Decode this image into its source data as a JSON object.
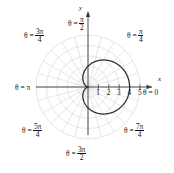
{
  "figure": {
    "type": "polar-plot",
    "background": "#ffffff",
    "grid_color": "#c9c9cf",
    "curve_color": "#2a2a2a",
    "axis_color": "#333333"
  },
  "axes": {
    "x_label": "x",
    "y_label": "y",
    "theta_zero_label": "θ = 0",
    "x_ticks": [
      "1",
      "2",
      "3",
      "4",
      "5"
    ]
  },
  "angle_labels": [
    {
      "name": "theta-pi-over-2",
      "prefix": "θ =",
      "num": "π",
      "den": "2",
      "whole": null
    },
    {
      "name": "theta-3pi-over-4",
      "prefix": "θ =",
      "num": "3π",
      "den": "4",
      "whole": null
    },
    {
      "name": "theta-pi-over-4",
      "prefix": "θ =",
      "num": "π",
      "den": "4",
      "whole": null
    },
    {
      "name": "theta-pi",
      "prefix": "θ =",
      "num": null,
      "den": null,
      "whole": "π"
    },
    {
      "name": "theta-5pi-over-4",
      "prefix": "θ =",
      "num": "5π",
      "den": "4",
      "whole": null
    },
    {
      "name": "theta-7pi-over-4",
      "prefix": "θ =",
      "num": "7π",
      "den": "4",
      "whole": null
    },
    {
      "name": "theta-3pi-over-2",
      "prefix": "θ =",
      "num": "3π",
      "den": "2",
      "whole": null
    }
  ],
  "chart_data": {
    "type": "line",
    "plot_kind": "polar",
    "title": "",
    "xlabel": "x",
    "ylabel": "y",
    "curve_name": "cardioid",
    "equation": "r = 2(1 + cos θ)",
    "r_max_axis": 5,
    "r_gridlines": [
      1,
      2,
      3,
      4,
      5
    ],
    "theta_gridlines_deg": [
      0,
      15,
      30,
      45,
      60,
      75,
      90,
      105,
      120,
      135,
      150,
      165,
      180,
      195,
      210,
      225,
      240,
      255,
      270,
      285,
      300,
      315,
      330,
      345
    ],
    "grid": true,
    "legend": "none",
    "tick_labels_x": [
      "1",
      "2",
      "3",
      "4",
      "5"
    ],
    "angle_tick_labels": [
      "θ = 0",
      "θ = π/4",
      "θ = π/2",
      "θ = 3π/4",
      "θ = π",
      "θ = 5π/4",
      "θ = 3π/2",
      "θ = 7π/4"
    ],
    "theta_deg": [
      0,
      10,
      20,
      30,
      40,
      50,
      60,
      70,
      80,
      90,
      100,
      110,
      120,
      130,
      140,
      150,
      160,
      170,
      180,
      190,
      200,
      210,
      220,
      230,
      240,
      250,
      260,
      270,
      280,
      290,
      300,
      310,
      320,
      330,
      340,
      350,
      360
    ],
    "r_values": [
      4.0,
      3.94,
      3.88,
      3.73,
      3.53,
      3.29,
      3.0,
      2.68,
      2.35,
      2.0,
      1.65,
      1.32,
      1.0,
      0.71,
      0.47,
      0.27,
      0.12,
      0.03,
      0.0,
      0.03,
      0.12,
      0.27,
      0.47,
      0.71,
      1.0,
      1.32,
      1.65,
      2.0,
      2.35,
      2.68,
      3.0,
      3.29,
      3.53,
      3.73,
      3.88,
      3.94,
      4.0
    ]
  }
}
